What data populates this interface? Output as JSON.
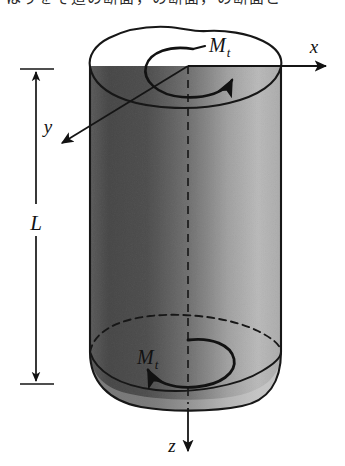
{
  "figure": {
    "caption_clipped_top": "はりをそ這の断面，の断面，の断面と",
    "background_color": "#ffffff",
    "ink_color": "#121212"
  },
  "labels": {
    "torque_top": "M",
    "torque_top_subscript": "t",
    "torque_bottom": "M",
    "torque_bottom_subscript": "t",
    "axis_x": "x",
    "axis_y": "y",
    "axis_z": "z",
    "length": "L"
  },
  "shaft": {
    "fill_gradient_left": "#8c8c8c",
    "fill_gradient_mid": "#b5b5b5",
    "fill_gradient_right": "#dcdcdc",
    "top_face_fill": "#ffffff",
    "outline_color": "#1a1a1a",
    "centerline_style": "dashed",
    "left_edge_x": 90,
    "right_edge_x": 281,
    "top_y": 66,
    "bottom_y": 404
  },
  "dimension": {
    "label": "L",
    "arrow_style": "double-headed",
    "top_tick_y": 70,
    "bottom_tick_y": 383,
    "line_x": 36
  },
  "axes": [
    {
      "name": "x",
      "direction": "right",
      "origin": [
        188,
        66
      ],
      "tip": [
        330,
        66
      ]
    },
    {
      "name": "y",
      "direction": "down-left",
      "origin": [
        188,
        66
      ],
      "tip": [
        58,
        146
      ]
    },
    {
      "name": "z",
      "direction": "down",
      "origin": [
        188,
        404
      ],
      "tip": [
        188,
        455
      ]
    }
  ],
  "torque_arrows": [
    {
      "label": "M_t",
      "location": "top-face",
      "rotation": "counterclockwise-from-above",
      "arrowhead": "right"
    },
    {
      "label": "M_t",
      "location": "bottom-face",
      "rotation": "counterclockwise-from-above",
      "arrowhead": "left"
    }
  ]
}
